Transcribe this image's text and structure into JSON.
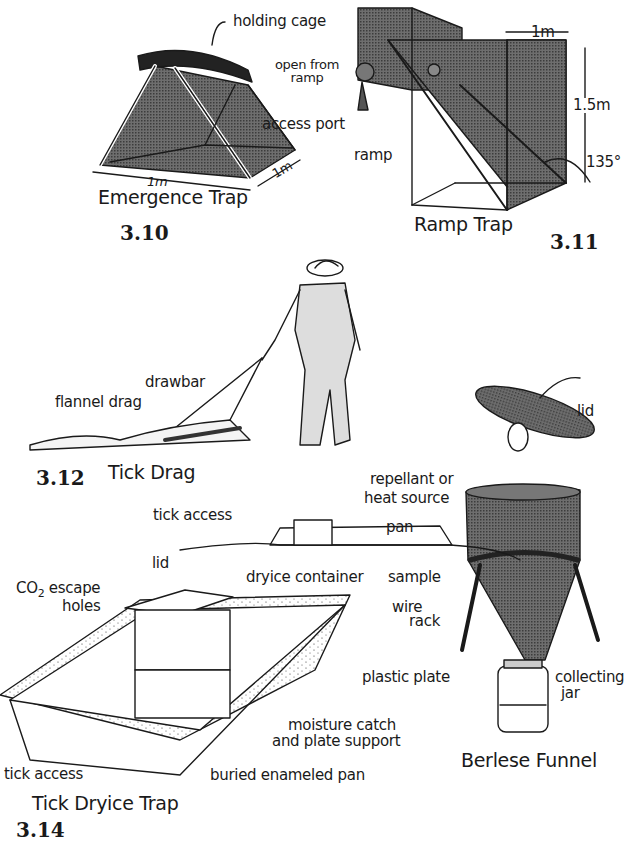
{
  "figures": [
    {
      "number": "3.10",
      "title": "Emergence Trap",
      "labels": {
        "holding_cage": "holding cage",
        "width": "1m",
        "depth": "1m"
      }
    },
    {
      "number": "3.11",
      "title": "Ramp Trap",
      "labels": {
        "open_from_ramp": "open from ramp",
        "access_port": "access port",
        "ramp": "ramp",
        "width": "1m",
        "height": "1.5m",
        "angle": "135°"
      }
    },
    {
      "number": "3.12",
      "title": "Tick Drag",
      "labels": {
        "flannel_drag": "flannel drag",
        "drawbar": "drawbar"
      }
    },
    {
      "number": "3.13",
      "title": "Berlese Funnel",
      "labels": {
        "lid": "lid",
        "repellant": "repellant or",
        "heat_source": "heat source",
        "sample": "sample",
        "wire": "wire",
        "rack": "rack",
        "collecting": "collecting",
        "jar": "jar"
      }
    },
    {
      "number": "3.14",
      "title": "Tick Dryice Trap",
      "labels": {
        "tick_access_top": "tick access",
        "pan": "pan",
        "lid": "lid",
        "co2": "CO",
        "co2_sub": "2",
        "escape": "escape",
        "holes": "holes",
        "dryice_container": "dryice container",
        "plastic_plate": "plastic plate",
        "moisture_catch": "moisture catch",
        "plate_support": "and plate support",
        "tick_access_bottom": "tick access",
        "buried_pan": "buried enameled pan"
      }
    }
  ]
}
